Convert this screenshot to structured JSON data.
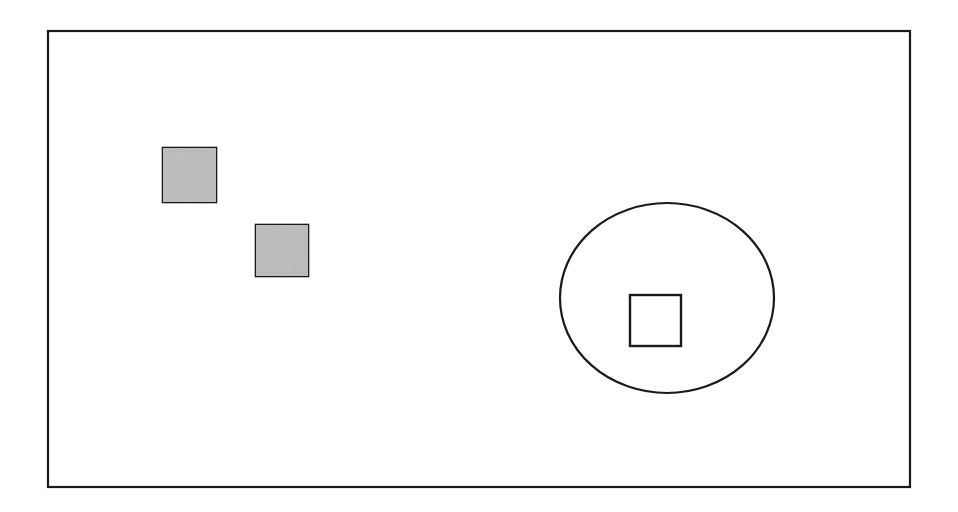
{
  "canvas": {
    "width": 958,
    "height": 512,
    "background_color": "#ffffff"
  },
  "diagram": {
    "stroke_color": "#1a1a1a",
    "fill_white": "#ffffff",
    "gray_fill": "#bcbcbc",
    "gray_fill_dark": "#a9a9a9"
  },
  "shapes": {
    "frame": {
      "name": "outer border rectangle",
      "x": 48,
      "y": 31,
      "width": 862,
      "height": 456,
      "stroke_width": 2.2,
      "stroke_color": "#1a1a1a",
      "fill": "#ffffff"
    },
    "gray_square_1": {
      "name": "upper left shaded square",
      "x": 163,
      "y": 148,
      "width": 53,
      "height": 54,
      "stroke_width": 2.6,
      "stroke_color": "#1a1a1a",
      "fill": "#bcbcbc"
    },
    "gray_square_2": {
      "name": "lower middle shaded square",
      "x": 256,
      "y": 225,
      "width": 52,
      "height": 51,
      "stroke_width": 2.6,
      "stroke_color": "#1a1a1a",
      "fill": "#bcbcbc"
    },
    "ellipse": {
      "name": "large ellipse outline",
      "cx": 667,
      "cy": 298,
      "rx": 107,
      "ry": 95,
      "stroke_width": 2.2,
      "stroke_color": "#1a1a1a",
      "fill": "none"
    },
    "inner_square": {
      "name": "white square inside ellipse",
      "x": 630,
      "y": 295,
      "width": 51,
      "height": 51,
      "stroke_width": 2.4,
      "stroke_color": "#1a1a1a",
      "fill": "#ffffff"
    }
  }
}
